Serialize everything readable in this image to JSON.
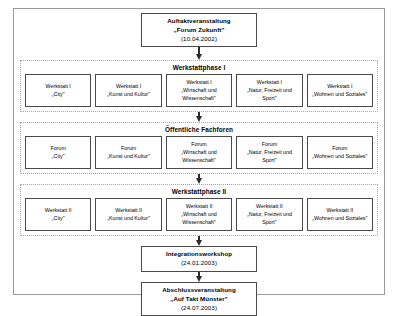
{
  "diagram": {
    "colors": {
      "frame_border": "#9a9a9a",
      "node_border": "#4a4a4a",
      "group_border": "#a7a7a7",
      "arrow": "#2b2b2b",
      "background": "#ffffff",
      "text": "#000000"
    },
    "start_node": {
      "title": "Auftaktveranstaltung",
      "subtitle": "„Forum Zukunft\"",
      "date": "(10.04.2002)"
    },
    "phase_one": {
      "heading": "Werkstattphase I",
      "items": [
        {
          "kind": "Werkstatt I",
          "name": "„City\""
        },
        {
          "kind": "Werkstatt I",
          "name": "„Kunst und Kultur\""
        },
        {
          "kind": "Werkstatt I",
          "name": "„Wirtschaft und Wissenschaft\""
        },
        {
          "kind": "Werkstatt I",
          "name": "„Natur, Freizeit und Sport\""
        },
        {
          "kind": "Werkstatt I",
          "name": "„Wohnen und Soziales\""
        }
      ]
    },
    "public_forums": {
      "heading": "Öffentliche Fachforen",
      "items": [
        {
          "kind": "Forum",
          "name": "„City\""
        },
        {
          "kind": "Forum",
          "name": "„Kunst und Kultur\""
        },
        {
          "kind": "Forum",
          "name": "„Wirtschaft und Wissenschaft\""
        },
        {
          "kind": "Forum",
          "name": "„Natur, Freizeit und Sport\""
        },
        {
          "kind": "Forum",
          "name": "„Wohnen und Soziales\""
        }
      ]
    },
    "phase_two": {
      "heading": "Werkstattphase II",
      "items": [
        {
          "kind": "Werkstatt II",
          "name": "„City\""
        },
        {
          "kind": "Werkstatt II",
          "name": "„Kunst und Kultur\""
        },
        {
          "kind": "Werkstatt II",
          "name": "„Wirtschaft und Wissenschaft\""
        },
        {
          "kind": "Werkstatt II",
          "name": "„Natur, Freizeit und Sport\""
        },
        {
          "kind": "Werkstatt II",
          "name": "„Wohnen und Soziales\""
        }
      ]
    },
    "integration_node": {
      "title": "Integrationsworkshop",
      "date": "(24.01.2003)"
    },
    "final_node": {
      "title": "Abschlussveranstaltung",
      "subtitle": "„Auf Takt Münster\"",
      "date": "(24.07.2003)"
    }
  }
}
